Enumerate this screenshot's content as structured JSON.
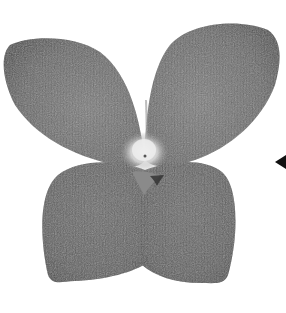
{
  "image": {
    "description": "Grayscale photograph of a four-petaled flower viewed from the front, with a black arrow pointing left at the right edge",
    "subject": "four-petaled flower",
    "petal_count": 4,
    "annotation": "arrow pointing left toward flower"
  },
  "colors": {
    "background": "#ffffff",
    "petal_dark": "#5a5a5a",
    "petal_mid": "#6e6e6e",
    "petal_light": "#8a8a8a",
    "center": "#e6e6e6",
    "arrow": "#111111"
  }
}
